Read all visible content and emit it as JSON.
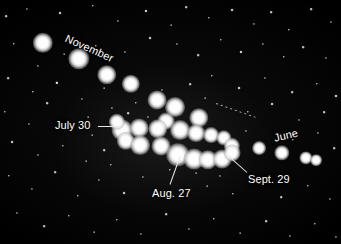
{
  "image": {
    "title": "Retrograde loop of a planet among the stars",
    "width": 341,
    "height": 244,
    "background_color": "#000000",
    "star_color": "#ffffff",
    "label_color": "#ffffff",
    "leader_color": "#e8e8e8"
  },
  "labels": [
    {
      "id": "november",
      "text": "November",
      "x": 68,
      "y": 33,
      "rotation": 24,
      "font_size": 11
    },
    {
      "id": "july-30",
      "text": "July 30",
      "x": 55,
      "y": 120,
      "rotation": 0,
      "font_size": 11
    },
    {
      "id": "aug-27",
      "text": "Aug. 27",
      "x": 152,
      "y": 188,
      "rotation": 0,
      "font_size": 11
    },
    {
      "id": "sept-29",
      "text": "Sept. 29",
      "x": 248,
      "y": 174,
      "rotation": 0,
      "font_size": 11
    },
    {
      "id": "june",
      "text": "June",
      "x": 273,
      "y": 133,
      "rotation": -13,
      "font_size": 11
    }
  ],
  "leader_lines": [
    {
      "id": "july-30-leader",
      "x1": 98,
      "y1": 126,
      "x2": 118,
      "y2": 126,
      "style": "solid"
    },
    {
      "id": "aug-27-leader",
      "x1": 170,
      "y1": 184,
      "x2": 180,
      "y2": 156,
      "style": "solid"
    },
    {
      "id": "sept-29-leader",
      "x1": 247,
      "y1": 172,
      "x2": 228,
      "y2": 155,
      "style": "solid"
    },
    {
      "id": "june-leader",
      "x1": 216,
      "y1": 103,
      "x2": 256,
      "y2": 117,
      "style": "dotted"
    }
  ],
  "planet_track": {
    "description": "Successive nightly positions of the planet tracing a retrograde loop",
    "dots": [
      {
        "x": 43,
        "y": 43,
        "r": 8.0
      },
      {
        "x": 79,
        "y": 59,
        "r": 8.4
      },
      {
        "x": 107,
        "y": 75,
        "r": 7.6
      },
      {
        "x": 131,
        "y": 84,
        "r": 7.2
      },
      {
        "x": 157,
        "y": 100,
        "r": 7.4
      },
      {
        "x": 175,
        "y": 107,
        "r": 7.8
      },
      {
        "x": 166,
        "y": 121,
        "r": 6.6
      },
      {
        "x": 199,
        "y": 118,
        "r": 7.6
      },
      {
        "x": 122,
        "y": 130,
        "r": 8.2
      },
      {
        "x": 139,
        "y": 128,
        "r": 7.4
      },
      {
        "x": 158,
        "y": 129,
        "r": 7.6
      },
      {
        "x": 180,
        "y": 130,
        "r": 7.8
      },
      {
        "x": 196,
        "y": 133,
        "r": 7.0
      },
      {
        "x": 211,
        "y": 135,
        "r": 6.2
      },
      {
        "x": 126,
        "y": 141,
        "r": 7.2
      },
      {
        "x": 140,
        "y": 145,
        "r": 7.8
      },
      {
        "x": 161,
        "y": 146,
        "r": 7.4
      },
      {
        "x": 224,
        "y": 138,
        "r": 6.0
      },
      {
        "x": 232,
        "y": 146,
        "r": 6.4
      },
      {
        "x": 178,
        "y": 155,
        "r": 9.2
      },
      {
        "x": 194,
        "y": 159,
        "r": 8.2
      },
      {
        "x": 208,
        "y": 160,
        "r": 7.6
      },
      {
        "x": 222,
        "y": 159,
        "r": 7.4
      },
      {
        "x": 232,
        "y": 153,
        "r": 6.6
      },
      {
        "x": 117,
        "y": 122,
        "r": 6.4
      },
      {
        "x": 259,
        "y": 148,
        "r": 5.4
      },
      {
        "x": 282,
        "y": 153,
        "r": 6.0
      },
      {
        "x": 306,
        "y": 158,
        "r": 5.2
      },
      {
        "x": 316,
        "y": 160,
        "r": 4.6
      }
    ]
  },
  "field_stars": [
    {
      "x": 6,
      "y": 16,
      "r": 1.0
    },
    {
      "x": 27,
      "y": 9,
      "r": 0.8
    },
    {
      "x": 60,
      "y": 13,
      "r": 1.1
    },
    {
      "x": 93,
      "y": 6,
      "r": 0.9
    },
    {
      "x": 118,
      "y": 21,
      "r": 0.8
    },
    {
      "x": 146,
      "y": 11,
      "r": 1.2
    },
    {
      "x": 171,
      "y": 25,
      "r": 0.7
    },
    {
      "x": 186,
      "y": 7,
      "r": 1.0
    },
    {
      "x": 209,
      "y": 18,
      "r": 0.9
    },
    {
      "x": 232,
      "y": 10,
      "r": 1.1
    },
    {
      "x": 254,
      "y": 24,
      "r": 0.8
    },
    {
      "x": 271,
      "y": 12,
      "r": 1.0
    },
    {
      "x": 289,
      "y": 30,
      "r": 0.9
    },
    {
      "x": 311,
      "y": 9,
      "r": 1.0
    },
    {
      "x": 331,
      "y": 22,
      "r": 0.8
    },
    {
      "x": 14,
      "y": 44,
      "r": 0.9
    },
    {
      "x": 38,
      "y": 66,
      "r": 0.8
    },
    {
      "x": 64,
      "y": 54,
      "r": 0.7
    },
    {
      "x": 96,
      "y": 46,
      "r": 0.9
    },
    {
      "x": 125,
      "y": 52,
      "r": 0.8
    },
    {
      "x": 150,
      "y": 38,
      "r": 1.1
    },
    {
      "x": 177,
      "y": 44,
      "r": 0.8
    },
    {
      "x": 198,
      "y": 55,
      "r": 1.0
    },
    {
      "x": 221,
      "y": 40,
      "r": 0.9
    },
    {
      "x": 241,
      "y": 52,
      "r": 1.2
    },
    {
      "x": 263,
      "y": 44,
      "r": 0.8
    },
    {
      "x": 284,
      "y": 57,
      "r": 0.9
    },
    {
      "x": 303,
      "y": 47,
      "r": 1.0
    },
    {
      "x": 326,
      "y": 58,
      "r": 0.8
    },
    {
      "x": 8,
      "y": 78,
      "r": 1.0
    },
    {
      "x": 33,
      "y": 92,
      "r": 0.9
    },
    {
      "x": 57,
      "y": 83,
      "r": 1.3
    },
    {
      "x": 82,
      "y": 99,
      "r": 0.8
    },
    {
      "x": 104,
      "y": 88,
      "r": 0.7
    },
    {
      "x": 136,
      "y": 103,
      "r": 0.9
    },
    {
      "x": 162,
      "y": 90,
      "r": 0.8
    },
    {
      "x": 190,
      "y": 84,
      "r": 1.0
    },
    {
      "x": 212,
      "y": 76,
      "r": 0.9
    },
    {
      "x": 239,
      "y": 88,
      "r": 1.1
    },
    {
      "x": 265,
      "y": 78,
      "r": 0.8
    },
    {
      "x": 292,
      "y": 92,
      "r": 1.0
    },
    {
      "x": 317,
      "y": 84,
      "r": 0.9
    },
    {
      "x": 336,
      "y": 96,
      "r": 1.2
    },
    {
      "x": 5,
      "y": 112,
      "r": 0.9
    },
    {
      "x": 29,
      "y": 124,
      "r": 0.8
    },
    {
      "x": 47,
      "y": 103,
      "r": 1.0
    },
    {
      "x": 88,
      "y": 117,
      "r": 0.7
    },
    {
      "x": 112,
      "y": 108,
      "r": 0.8
    },
    {
      "x": 205,
      "y": 98,
      "r": 0.7
    },
    {
      "x": 248,
      "y": 112,
      "r": 0.9
    },
    {
      "x": 272,
      "y": 104,
      "r": 1.1
    },
    {
      "x": 299,
      "y": 120,
      "r": 0.8
    },
    {
      "x": 324,
      "y": 112,
      "r": 1.0
    },
    {
      "x": 12,
      "y": 142,
      "r": 1.1
    },
    {
      "x": 38,
      "y": 155,
      "r": 0.8
    },
    {
      "x": 63,
      "y": 146,
      "r": 0.9
    },
    {
      "x": 86,
      "y": 161,
      "r": 0.7
    },
    {
      "x": 104,
      "y": 150,
      "r": 1.0
    },
    {
      "x": 246,
      "y": 131,
      "r": 0.8
    },
    {
      "x": 293,
      "y": 140,
      "r": 0.9
    },
    {
      "x": 318,
      "y": 133,
      "r": 0.8
    },
    {
      "x": 334,
      "y": 148,
      "r": 1.0
    },
    {
      "x": 9,
      "y": 176,
      "r": 0.9
    },
    {
      "x": 32,
      "y": 189,
      "r": 0.8
    },
    {
      "x": 55,
      "y": 172,
      "r": 1.0
    },
    {
      "x": 78,
      "y": 196,
      "r": 0.9
    },
    {
      "x": 99,
      "y": 180,
      "r": 0.8
    },
    {
      "x": 124,
      "y": 193,
      "r": 1.1
    },
    {
      "x": 143,
      "y": 177,
      "r": 0.8
    },
    {
      "x": 207,
      "y": 186,
      "r": 0.7
    },
    {
      "x": 233,
      "y": 194,
      "r": 0.9
    },
    {
      "x": 259,
      "y": 183,
      "r": 0.8
    },
    {
      "x": 281,
      "y": 197,
      "r": 1.0
    },
    {
      "x": 308,
      "y": 186,
      "r": 0.9
    },
    {
      "x": 330,
      "y": 199,
      "r": 0.8
    },
    {
      "x": 17,
      "y": 213,
      "r": 0.8
    },
    {
      "x": 44,
      "y": 226,
      "r": 1.0
    },
    {
      "x": 69,
      "y": 216,
      "r": 0.9
    },
    {
      "x": 94,
      "y": 232,
      "r": 0.7
    },
    {
      "x": 117,
      "y": 220,
      "r": 0.9
    },
    {
      "x": 141,
      "y": 234,
      "r": 0.8
    },
    {
      "x": 166,
      "y": 214,
      "r": 1.0
    },
    {
      "x": 189,
      "y": 229,
      "r": 0.8
    },
    {
      "x": 214,
      "y": 219,
      "r": 0.9
    },
    {
      "x": 240,
      "y": 233,
      "r": 0.7
    },
    {
      "x": 266,
      "y": 221,
      "r": 1.0
    },
    {
      "x": 290,
      "y": 236,
      "r": 0.8
    },
    {
      "x": 315,
      "y": 224,
      "r": 0.9
    },
    {
      "x": 336,
      "y": 237,
      "r": 0.8
    },
    {
      "x": 128,
      "y": 113,
      "r": 1.0
    },
    {
      "x": 148,
      "y": 117,
      "r": 0.8
    },
    {
      "x": 170,
      "y": 170,
      "r": 0.9
    },
    {
      "x": 196,
      "y": 173,
      "r": 0.7
    },
    {
      "x": 220,
      "y": 176,
      "r": 0.8
    },
    {
      "x": 111,
      "y": 165,
      "r": 0.9
    },
    {
      "x": 92,
      "y": 135,
      "r": 0.7
    },
    {
      "x": 71,
      "y": 127,
      "r": 0.8
    }
  ]
}
